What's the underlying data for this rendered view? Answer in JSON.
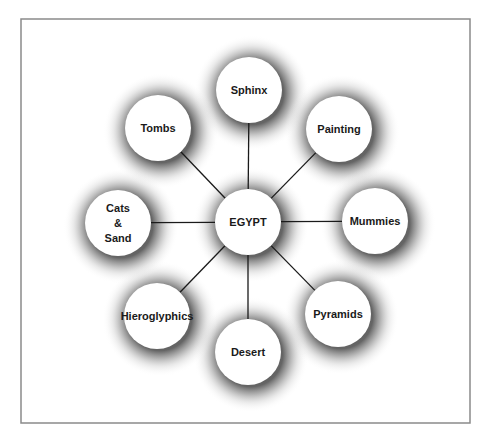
{
  "diagram": {
    "type": "concept-map",
    "frame": {
      "x": 21,
      "y": 19,
      "width": 449,
      "height": 404,
      "stroke": "#8a8a8a"
    },
    "center": {
      "id": "egypt",
      "label": "EGYPT",
      "cx": 248,
      "cy": 222,
      "r": 33
    },
    "nodes": [
      {
        "id": "sphinx",
        "lines": [
          "Sphinx"
        ],
        "cx": 249,
        "cy": 90,
        "r": 33
      },
      {
        "id": "painting",
        "lines": [
          "Painting"
        ],
        "cx": 339,
        "cy": 129,
        "r": 33
      },
      {
        "id": "mummies",
        "lines": [
          "Mummies"
        ],
        "cx": 375,
        "cy": 221,
        "r": 33
      },
      {
        "id": "pyramids",
        "lines": [
          "Pyramids"
        ],
        "cx": 338,
        "cy": 314,
        "r": 33
      },
      {
        "id": "desert",
        "lines": [
          "Desert"
        ],
        "cx": 248,
        "cy": 352,
        "r": 33
      },
      {
        "id": "hieroglyphics",
        "lines": [
          "Hieroglyphics"
        ],
        "cx": 157,
        "cy": 316,
        "r": 33
      },
      {
        "id": "cats-and-sand",
        "lines": [
          "Cats",
          "&",
          "Sand"
        ],
        "cx": 118,
        "cy": 223,
        "r": 33
      },
      {
        "id": "tombs",
        "lines": [
          "Tombs"
        ],
        "cx": 158,
        "cy": 128,
        "r": 33
      }
    ],
    "colors": {
      "line": "#1a1a1a",
      "shadow": "#555555",
      "node_fill": "#ffffff",
      "text": "#1a1a1a"
    }
  }
}
